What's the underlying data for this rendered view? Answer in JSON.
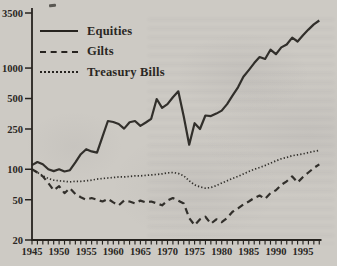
{
  "figure": {
    "paper_color": "#cdcac4",
    "ink_color": "#26231f"
  },
  "legend": {
    "items": [
      {
        "label": "Equities",
        "style": "solid"
      },
      {
        "label": "Gilts",
        "style": "dashed"
      },
      {
        "label": "Treasury Bills",
        "style": "dotted"
      }
    ]
  },
  "chart_data": {
    "type": "line",
    "title": "",
    "xlabel": "",
    "ylabel": "",
    "y_axis": {
      "scale": "log",
      "ticks": [
        20,
        50,
        100,
        250,
        500,
        1000,
        3500
      ],
      "range": [
        20,
        3500
      ]
    },
    "x_axis": {
      "labeled_ticks": [
        1945,
        1950,
        1955,
        1960,
        1965,
        1970,
        1975,
        1980,
        1985,
        1990,
        1995
      ],
      "minor_tick_every": 1,
      "range": [
        1945,
        1998
      ]
    },
    "grid": false,
    "legend_position": "upper-left-inside",
    "x": [
      1945,
      1946,
      1947,
      1948,
      1949,
      1950,
      1951,
      1952,
      1953,
      1954,
      1955,
      1956,
      1957,
      1958,
      1959,
      1960,
      1961,
      1962,
      1963,
      1964,
      1965,
      1966,
      1967,
      1968,
      1969,
      1970,
      1971,
      1972,
      1973,
      1974,
      1975,
      1976,
      1977,
      1978,
      1979,
      1980,
      1981,
      1982,
      1983,
      1984,
      1985,
      1986,
      1987,
      1988,
      1989,
      1990,
      1991,
      1992,
      1993,
      1994,
      1995,
      1996,
      1997,
      1998
    ],
    "series": [
      {
        "name": "Equities",
        "style": "solid",
        "values": [
          110,
          118,
          112,
          100,
          96,
          100,
          95,
          98,
          117,
          141,
          158,
          150,
          146,
          210,
          300,
          293,
          280,
          252,
          292,
          300,
          268,
          290,
          315,
          495,
          405,
          440,
          515,
          590,
          330,
          175,
          285,
          250,
          340,
          335,
          355,
          380,
          440,
          535,
          645,
          820,
          955,
          1120,
          1285,
          1230,
          1520,
          1370,
          1600,
          1710,
          2000,
          1830,
          2110,
          2400,
          2700,
          2950
        ]
      },
      {
        "name": "Gilts",
        "style": "dashed",
        "values": [
          100,
          93,
          85,
          73,
          62,
          68,
          58,
          65,
          57,
          53,
          50,
          52,
          50,
          48,
          51,
          47,
          44,
          49,
          48,
          46,
          49,
          47,
          48,
          46,
          44,
          49,
          52,
          49,
          46,
          33,
          28,
          32,
          34,
          29,
          32,
          30,
          33,
          38,
          41,
          45,
          48,
          52,
          55,
          51,
          58,
          62,
          70,
          76,
          85,
          74,
          84,
          93,
          103,
          112
        ]
      },
      {
        "name": "Treasury Bills",
        "style": "dotted",
        "values": [
          100,
          93,
          86,
          81,
          78,
          77,
          76,
          75,
          76,
          76,
          77,
          78,
          80,
          81,
          82,
          83,
          84,
          84,
          85,
          86,
          86,
          87,
          88,
          89,
          90,
          92,
          93,
          91,
          86,
          77,
          70,
          67,
          65,
          66,
          69,
          73,
          77,
          81,
          85,
          90,
          95,
          100,
          104,
          109,
          115,
          121,
          127,
          131,
          136,
          139,
          142,
          146,
          150,
          154
        ]
      }
    ]
  }
}
